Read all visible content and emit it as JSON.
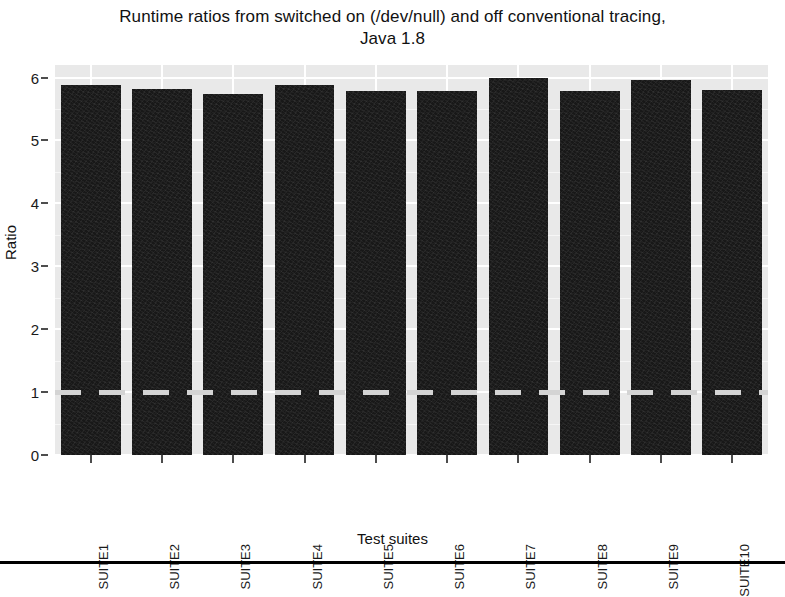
{
  "chart_data": {
    "type": "bar",
    "title": "Runtime ratios from switched on (/dev/null) and off conventional tracing, Java 1.8",
    "title_line1": "Runtime ratios from switched on (/dev/null) and off conventional tracing,",
    "title_line2": "Java 1.8",
    "xlabel": "Test suites",
    "ylabel": "Ratio",
    "categories": [
      "SUITE1",
      "SUITE2",
      "SUITE3",
      "SUITE4",
      "SUITE5",
      "SUITE6",
      "SUITE7",
      "SUITE8",
      "SUITE9",
      "SUITE10"
    ],
    "values": [
      5.88,
      5.82,
      5.74,
      5.89,
      5.79,
      5.78,
      5.99,
      5.79,
      5.96,
      5.81
    ],
    "ylim": [
      0,
      6.2
    ],
    "y_ticks": [
      0,
      1,
      2,
      3,
      4,
      5,
      6
    ],
    "y_tick_labels": [
      "0",
      "1",
      "2",
      "3",
      "4",
      "5",
      "6"
    ],
    "grid": true,
    "legend": "none",
    "bar_color": "#181818",
    "panel_color": "#e9e9e9",
    "gridline_color": "#ffffff",
    "reference_line": {
      "value": 1,
      "style": "dashed",
      "color": "#d4d4d4"
    }
  },
  "axis": {
    "y_title": "Ratio",
    "x_title": "Test suites"
  }
}
